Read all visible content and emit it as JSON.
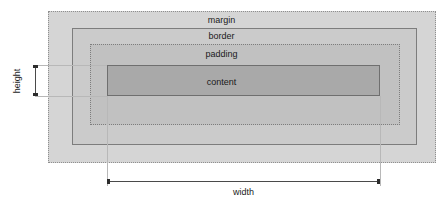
{
  "diagram": {
    "type": "box-model",
    "layers": [
      {
        "key": "margin",
        "label": "margin",
        "fill": "#d5d5d5",
        "stroke": "#8f8f8f",
        "stroke_style": "dotted",
        "x": 48,
        "y": 11,
        "width": 388,
        "height": 152
      },
      {
        "key": "border",
        "label": "border",
        "fill": "#cbcbcb",
        "stroke": "#7d7d7d",
        "stroke_style": "solid",
        "x": 72,
        "y": 28,
        "width": 345,
        "height": 117
      },
      {
        "key": "padding",
        "label": "padding",
        "fill": "#c1c1c1",
        "stroke": "#7d7d7d",
        "stroke_style": "dotted",
        "x": 90,
        "y": 44,
        "width": 310,
        "height": 81
      },
      {
        "key": "content",
        "label": "content",
        "fill": "#a9a9a9",
        "stroke": "#6f6f6f",
        "stroke_style": "solid",
        "x": 107,
        "y": 65,
        "width": 273,
        "height": 31
      }
    ],
    "dimensions": {
      "height": {
        "label": "height",
        "orientation": "vertical",
        "from": 65,
        "to": 96,
        "axis_pos": 35
      },
      "width": {
        "label": "width",
        "orientation": "horizontal",
        "from": 107,
        "to": 380,
        "axis_pos": 181
      }
    },
    "colors": {
      "background": "#ffffff",
      "text": "#1a1a1a",
      "guide_line": "#b8b8b8",
      "dimension_line": "#4a4a4a"
    }
  }
}
